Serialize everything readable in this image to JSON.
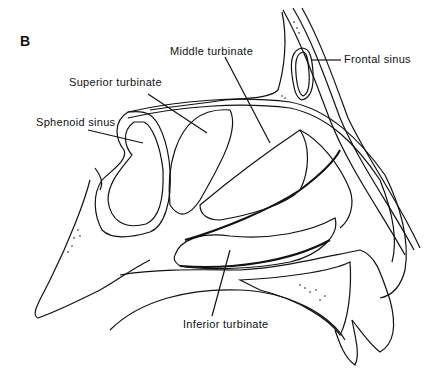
{
  "figure": {
    "panel_label": "B",
    "labels": {
      "middle_turbinate": "Middle turbinate",
      "superior_turbinate": "Superior turbinate",
      "sphenoid_sinus": "Sphenoid sinus",
      "frontal_sinus": "Frontal sinus",
      "inferior_turbinate": "Inferior turbinate"
    },
    "colors": {
      "ink": "#111111",
      "background": "#ffffff"
    }
  }
}
